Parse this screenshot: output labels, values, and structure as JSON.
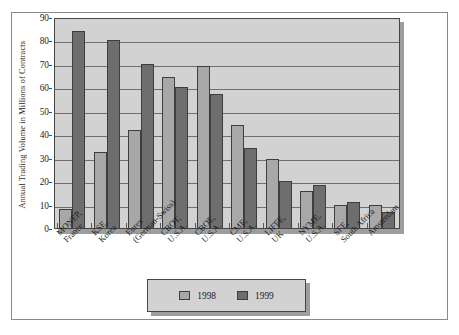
{
  "chart_data": {
    "type": "bar",
    "title": "",
    "xlabel": "",
    "ylabel": "Annual Trading Volume in Millions of Contracts",
    "ylim": [
      0,
      90
    ],
    "ytick_step": 10,
    "yticks": [
      0,
      10,
      20,
      30,
      40,
      50,
      60,
      70,
      80,
      90
    ],
    "grid": true,
    "legend_position": "bottom",
    "categories": [
      "MONEP, France",
      "KSE, Korea",
      "Eurex (German-Swiss)",
      "CBOT, U.S.A.",
      "CBOE, U.S.A.",
      "CME, U.S.A.",
      "LIFFE, UK",
      "NYME, U.S.A.",
      "SFE, South Africa",
      "Amsterdam"
    ],
    "category_lines": [
      [
        "MONEP,",
        "France"
      ],
      [
        "KSE,",
        "Korea"
      ],
      [
        "Eurex",
        "(German-Swiss)"
      ],
      [
        "CBOT,",
        "U.S.A."
      ],
      [
        "CBOE,",
        "U.S.A."
      ],
      [
        "CME,",
        "U.S.A."
      ],
      [
        "LIFFE,",
        "UK"
      ],
      [
        "NYME,",
        "U.S.A."
      ],
      [
        "SFE,",
        "South Africa"
      ],
      [
        "Amsterdam"
      ]
    ],
    "series": [
      {
        "name": "1998",
        "color": "#a8a8a8",
        "values": [
          8,
          32.5,
          42,
          64.5,
          69,
          44,
          29.5,
          16,
          10,
          9.7
        ]
      },
      {
        "name": "1999",
        "color": "#6e6e6e",
        "values": [
          84,
          80,
          70,
          60,
          57,
          34,
          20,
          18.3,
          11,
          7
        ]
      }
    ]
  },
  "legend": {
    "entries": [
      {
        "label": "1998"
      },
      {
        "label": "1999"
      }
    ]
  },
  "colors": {
    "series_1998": "#a8a8a8",
    "series_1999": "#6e6e6e",
    "plot_background": "#d2d2d2",
    "plot_border": "#454545",
    "gridline": "#6f6f6f",
    "shadow": "#9d9d9d",
    "text": "#1c1c1c"
  }
}
